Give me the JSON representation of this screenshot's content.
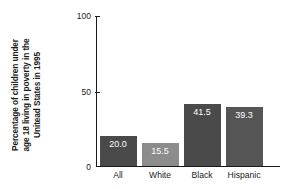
{
  "chart_data": {
    "type": "bar",
    "title": "",
    "subtitle": "",
    "xlabel": "",
    "ylabel": "Percentage of children under age 18 living in poverty in the Unitead States in 1995",
    "ylabel_lines": [
      "Percentage of children under",
      "age 18 living in poverty in the",
      "Unitead States in 1995"
    ],
    "categories": [
      "All",
      "White",
      "Black",
      "Hispanic"
    ],
    "values": [
      20.0,
      15.5,
      41.5,
      39.3
    ],
    "value_labels": [
      "20.0",
      "15.5",
      "41.5",
      "39.3"
    ],
    "bar_colors": [
      "#4a4a4a",
      "#8c8c8c",
      "#4a4a4a",
      "#555555"
    ],
    "value_label_color": "#ffffff",
    "ylim": [
      0,
      100
    ],
    "yticks": [
      0,
      50,
      100
    ],
    "ytick_labels": [
      "0",
      "50",
      "100"
    ],
    "grid": false,
    "legend": false,
    "legend_position": "none",
    "axis_color": "#1a1a1a",
    "background": "#ffffff"
  }
}
